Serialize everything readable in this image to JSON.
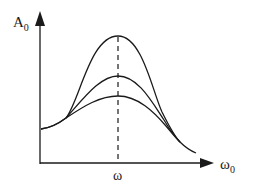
{
  "diagram": {
    "y_axis": {
      "label": "A",
      "subscript": "0"
    },
    "x_axis": {
      "label": "ω",
      "subscript": "0"
    },
    "peak_marker": {
      "label": "ω"
    },
    "colors": {
      "stroke": "#1a1a1a",
      "background": "#ffffff"
    },
    "curves": [
      {
        "name": "low-damping",
        "peak": "highest"
      },
      {
        "name": "medium-damping",
        "peak": "middle"
      },
      {
        "name": "high-damping",
        "peak": "lowest"
      }
    ]
  }
}
